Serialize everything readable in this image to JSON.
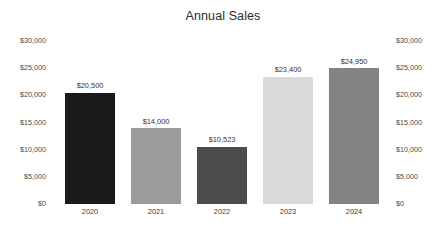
{
  "chart_data": {
    "type": "bar",
    "title": "Annual Sales",
    "xlabel": "",
    "ylabel": "",
    "categories": [
      "2020",
      "2021",
      "2022",
      "2023",
      "2024"
    ],
    "values": [
      20500,
      14000,
      10523,
      23400,
      24950
    ],
    "value_labels": [
      "$20,500",
      "$14,000",
      "$10,523",
      "$23,400",
      "$24,950"
    ],
    "bar_colors": [
      "#1a1a1a",
      "#9b9b9b",
      "#4c4c4c",
      "#d9d9d9",
      "#838383"
    ],
    "ylim": [
      0,
      30000
    ],
    "ytick_values": [
      30000,
      25000,
      20000,
      15000,
      10000,
      5000,
      0
    ],
    "ytick_labels": [
      "$30,000",
      "$25,000",
      "$20,000",
      "$15,000",
      "$10,000",
      "$5,000",
      "$0"
    ],
    "right_axis": {
      "enabled": true,
      "ylim": [
        0,
        30000
      ],
      "ytick_labels": [
        "$30,000",
        "$25,000",
        "$20,000",
        "$15,000",
        "$10,000",
        "$5,000",
        "$0"
      ]
    },
    "grid": false,
    "legend": false,
    "background_color": "#ffffff"
  }
}
